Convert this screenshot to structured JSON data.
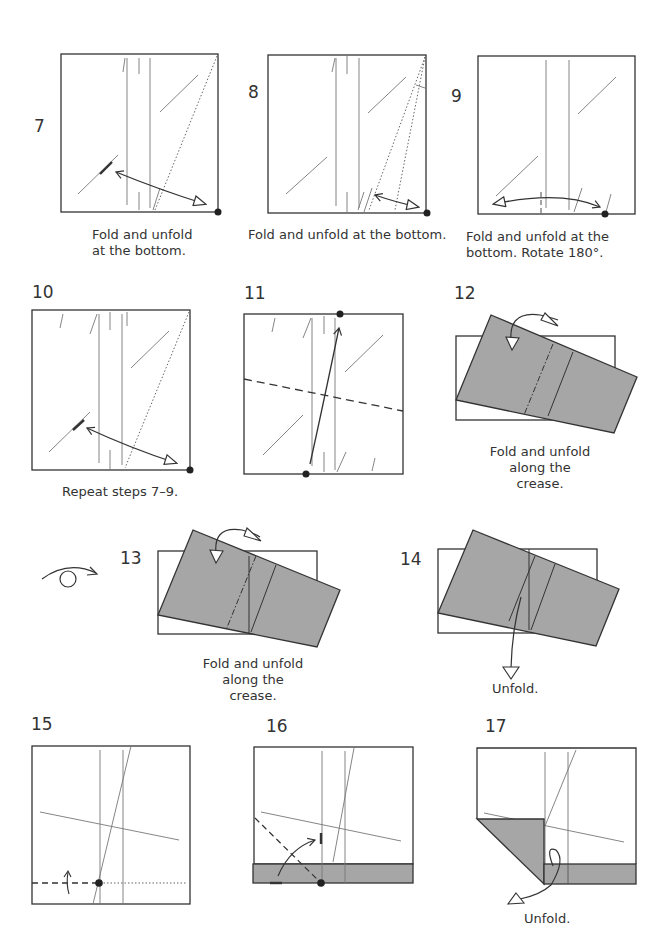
{
  "colors": {
    "paper_back": "#a6a6a6",
    "line": "#333333",
    "crease": "#777777",
    "background": "#ffffff"
  },
  "steps": [
    {
      "number": "7",
      "caption_lines": [
        "Fold and unfold",
        "at the bottom."
      ]
    },
    {
      "number": "8",
      "caption_lines": [
        "Fold and unfold at the bottom."
      ]
    },
    {
      "number": "9",
      "caption_lines": [
        "Fold and unfold at the",
        "bottom. Rotate 180°."
      ]
    },
    {
      "number": "10",
      "caption_lines": [
        "Repeat steps 7–9."
      ]
    },
    {
      "number": "11",
      "caption_lines": []
    },
    {
      "number": "12",
      "caption_lines": [
        "Fold and unfold",
        "along the crease."
      ]
    },
    {
      "number": "13",
      "caption_lines": [
        "Fold and unfold",
        "along the crease."
      ]
    },
    {
      "number": "14",
      "caption_lines": [
        "Unfold."
      ]
    },
    {
      "number": "15",
      "caption_lines": []
    },
    {
      "number": "16",
      "caption_lines": []
    },
    {
      "number": "17",
      "caption_lines": [
        "Unfold."
      ]
    }
  ],
  "symbols": {
    "turn_over": "turn-over-icon"
  }
}
